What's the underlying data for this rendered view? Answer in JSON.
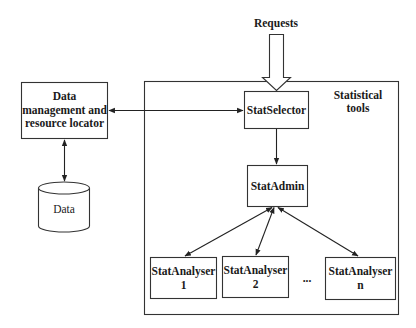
{
  "diagram": {
    "type": "architecture block diagram",
    "colors": {
      "stroke": "#333333",
      "text": "#1a1a1a",
      "background": "#ffffff"
    },
    "requests": {
      "label": "Requests"
    },
    "data_management": {
      "line1": "Data",
      "line2": "management and",
      "line3": "resource locator"
    },
    "data_store": {
      "label": "Data"
    },
    "statistical_tools": {
      "line1": "Statistical",
      "line2": "tools"
    },
    "stat_selector": {
      "label": "StatSelector"
    },
    "stat_admin": {
      "label": "StatAdmin"
    },
    "analysers": [
      {
        "line1": "StatAnalyser",
        "line2": "1"
      },
      {
        "line1": "StatAnalyser",
        "line2": "2"
      },
      {
        "line1": "StatAnalyser",
        "line2": "n"
      }
    ],
    "ellipsis": "...",
    "connections": [
      {
        "from": "Requests",
        "to": "StatSelector",
        "style": "hollow block arrow"
      },
      {
        "from": "StatSelector",
        "to": "Data management and resource locator",
        "style": "bidirectional arrow"
      },
      {
        "from": "Data management and resource locator",
        "to": "Data",
        "style": "bidirectional arrow"
      },
      {
        "from": "StatSelector",
        "to": "StatAdmin",
        "style": "arrow"
      },
      {
        "from": "StatAdmin",
        "to": "StatAnalyser 1",
        "style": "bidirectional arrow"
      },
      {
        "from": "StatAdmin",
        "to": "StatAnalyser 2",
        "style": "bidirectional arrow"
      },
      {
        "from": "StatAdmin",
        "to": "StatAnalyser n",
        "style": "bidirectional arrow"
      }
    ]
  }
}
